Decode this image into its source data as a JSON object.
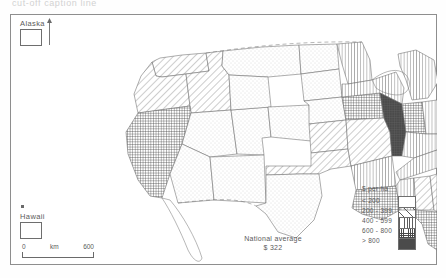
{
  "caption": {
    "text": "cut-off caption line"
  },
  "insets": {
    "alaska_label": "Alaska",
    "hawaii_label": "Hawaii"
  },
  "scale": {
    "min": "0",
    "unit": "km",
    "max": "600"
  },
  "annotation": {
    "line1": "National average",
    "line2": "$ 322"
  },
  "legend": {
    "title": "$ per ha",
    "classes": [
      {
        "label": "< 200",
        "pattern": "blank"
      },
      {
        "label": "200 - 399",
        "pattern": "diagonal-hatch"
      },
      {
        "label": "400 - 599",
        "pattern": "vertical-lines"
      },
      {
        "label": "600 - 800",
        "pattern": "crosshatch"
      },
      {
        "label": "> 800",
        "pattern": "solid-dark"
      }
    ]
  },
  "map": {
    "title": "United States farmland value by state",
    "units": "$ per ha",
    "national_average": 322,
    "projection_note": "conterminous United States with Alaska and Hawaii insets",
    "states": [
      {
        "name": "Washington",
        "class": "200 - 399",
        "pattern": "diagonal-hatch"
      },
      {
        "name": "Oregon",
        "class": "200 - 399",
        "pattern": "diagonal-hatch"
      },
      {
        "name": "Idaho",
        "class": "200 - 399",
        "pattern": "diagonal-hatch"
      },
      {
        "name": "California",
        "class": "600 - 800",
        "pattern": "crosshatch"
      },
      {
        "name": "Nevada",
        "class": "< 200",
        "pattern": "blank"
      },
      {
        "name": "Montana",
        "class": "< 200",
        "pattern": "blank"
      },
      {
        "name": "Wyoming",
        "class": "< 200",
        "pattern": "blank"
      },
      {
        "name": "Utah",
        "class": "< 200",
        "pattern": "blank"
      },
      {
        "name": "Arizona",
        "class": "< 200",
        "pattern": "blank"
      },
      {
        "name": "Colorado",
        "class": "< 200",
        "pattern": "blank"
      },
      {
        "name": "New Mexico",
        "class": "< 200",
        "pattern": "blank"
      },
      {
        "name": "North Dakota",
        "class": "< 200",
        "pattern": "blank"
      },
      {
        "name": "South Dakota",
        "class": "< 200",
        "pattern": "blank"
      },
      {
        "name": "Nebraska",
        "class": "< 200",
        "pattern": "blank"
      },
      {
        "name": "Kansas",
        "class": "200 - 399",
        "pattern": "diagonal-hatch"
      },
      {
        "name": "Oklahoma",
        "class": "200 - 399",
        "pattern": "diagonal-hatch"
      },
      {
        "name": "Texas",
        "class": "< 200",
        "pattern": "blank"
      },
      {
        "name": "Minnesota",
        "class": "400 - 599",
        "pattern": "vertical-lines"
      },
      {
        "name": "Iowa",
        "class": "600 - 800",
        "pattern": "crosshatch"
      },
      {
        "name": "Missouri",
        "class": "200 - 399",
        "pattern": "diagonal-hatch"
      },
      {
        "name": "Arkansas",
        "class": "400 - 599",
        "pattern": "vertical-lines"
      },
      {
        "name": "Louisiana",
        "class": "600 - 800",
        "pattern": "crosshatch"
      },
      {
        "name": "Wisconsin",
        "class": "400 - 599",
        "pattern": "vertical-lines"
      },
      {
        "name": "Illinois",
        "class": "> 800",
        "pattern": "solid-dark"
      },
      {
        "name": "Indiana",
        "class": "600 - 800",
        "pattern": "crosshatch"
      },
      {
        "name": "Michigan",
        "class": "400 - 599",
        "pattern": "vertical-lines"
      },
      {
        "name": "Ohio",
        "class": "400 - 599",
        "pattern": "vertical-lines"
      },
      {
        "name": "Kentucky",
        "class": "400 - 599",
        "pattern": "vertical-lines"
      },
      {
        "name": "Tennessee",
        "class": "400 - 599",
        "pattern": "vertical-lines"
      },
      {
        "name": "Mississippi",
        "class": "400 - 599",
        "pattern": "vertical-lines"
      },
      {
        "name": "Alabama",
        "class": "200 - 399",
        "pattern": "diagonal-hatch"
      },
      {
        "name": "Georgia",
        "class": "200 - 399",
        "pattern": "diagonal-hatch"
      },
      {
        "name": "Florida",
        "class": "600 - 800",
        "pattern": "crosshatch"
      },
      {
        "name": "South Carolina",
        "class": "200 - 399",
        "pattern": "diagonal-hatch"
      },
      {
        "name": "North Carolina",
        "class": "200 - 399",
        "pattern": "diagonal-hatch"
      },
      {
        "name": "Virginia",
        "class": "200 - 399",
        "pattern": "diagonal-hatch"
      },
      {
        "name": "West Virginia",
        "class": "200 - 399",
        "pattern": "diagonal-hatch"
      },
      {
        "name": "Pennsylvania",
        "class": "400 - 599",
        "pattern": "vertical-lines"
      },
      {
        "name": "New York",
        "class": "200 - 399",
        "pattern": "diagonal-hatch"
      },
      {
        "name": "Maryland",
        "class": "> 800",
        "pattern": "solid-dark"
      },
      {
        "name": "Delaware",
        "class": "> 800",
        "pattern": "solid-dark"
      },
      {
        "name": "New Jersey",
        "class": "> 800",
        "pattern": "solid-dark"
      },
      {
        "name": "Connecticut",
        "class": "600 - 800",
        "pattern": "crosshatch"
      },
      {
        "name": "Rhode Island",
        "class": "> 800",
        "pattern": "solid-dark"
      },
      {
        "name": "Massachusetts",
        "class": "600 - 800",
        "pattern": "crosshatch"
      },
      {
        "name": "Vermont",
        "class": "200 - 399",
        "pattern": "diagonal-hatch"
      },
      {
        "name": "New Hampshire",
        "class": "200 - 399",
        "pattern": "diagonal-hatch"
      },
      {
        "name": "Maine",
        "class": "200 - 399",
        "pattern": "diagonal-hatch"
      },
      {
        "name": "Alaska",
        "class": "< 200",
        "pattern": "blank"
      },
      {
        "name": "Hawaii",
        "class": "< 200",
        "pattern": "blank"
      }
    ]
  }
}
